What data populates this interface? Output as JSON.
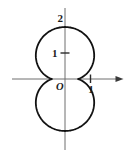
{
  "figure": {
    "labels": {
      "origin": "O",
      "x_tick_1": "1",
      "y_tick_1": "1",
      "y_top": "2"
    },
    "colors": {
      "background": "#ffffff",
      "axis": "#6e6e6e",
      "arrowhead": "#3a3a3a",
      "curve": "#111111",
      "text": "#1a1a1a"
    }
  },
  "chart_data": {
    "type": "line",
    "title": "",
    "xlabel": "",
    "ylabel": "",
    "grid": false,
    "legend": false,
    "curve": {
      "form": "polar",
      "equation": "r = 0.5 + 1.5*abs(sin(theta))",
      "r_base": 0.5,
      "r_sin_coeff": 1.5,
      "closed": true,
      "description": "Peanut-shaped closed curve, symmetric about both axes, pinched waist on the x-axis"
    },
    "key_points": [
      [
        0,
        2
      ],
      [
        0.5,
        0
      ],
      [
        -0.5,
        0
      ],
      [
        0,
        -2
      ],
      [
        1.12,
        0.87
      ],
      [
        -1.12,
        0.87
      ],
      [
        -1.12,
        -0.87
      ],
      [
        1.12,
        -0.87
      ]
    ],
    "x_ticks": [
      {
        "value": 1,
        "label": "1"
      }
    ],
    "y_ticks": [
      {
        "value": 1,
        "label": "1"
      },
      {
        "value": 2,
        "label": "2"
      }
    ],
    "xlim": [
      -2.0,
      2.2
    ],
    "ylim": [
      -2.75,
      2.75
    ]
  }
}
